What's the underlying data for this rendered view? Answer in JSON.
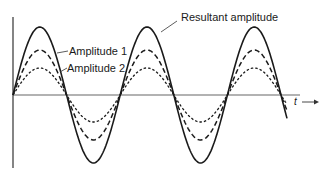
{
  "diagram": {
    "labels": {
      "resultant": "Resultant amplitude",
      "amp1": "Amplitude 1",
      "amp2": "Amplitude 2",
      "time_axis": "t"
    },
    "waves": [
      {
        "name": "Resultant amplitude",
        "style": "solid",
        "amplitude_px": 68
      },
      {
        "name": "Amplitude 1",
        "style": "long-dash",
        "amplitude_px": 45
      },
      {
        "name": "Amplitude 2",
        "style": "short-dash",
        "amplitude_px": 27
      }
    ],
    "colors": {
      "line": "#1a1a1a",
      "axis": "#555555",
      "background": "#ffffff"
    }
  }
}
